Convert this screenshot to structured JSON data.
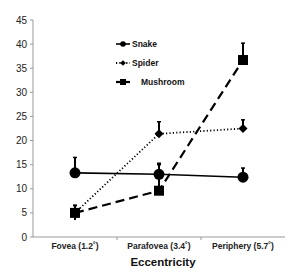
{
  "chart_data": {
    "type": "line",
    "title": "",
    "xlabel": "Eccentricity",
    "ylabel": "",
    "ylim": [
      0,
      45
    ],
    "yticks": [
      0,
      5,
      10,
      15,
      20,
      25,
      30,
      35,
      40,
      45
    ],
    "categories": [
      "Fovea (1.2˚)",
      "Parafovea (3.4˚)",
      "Periphery (5.7˚)"
    ],
    "grid": false,
    "legend_position": "top-center",
    "series": [
      {
        "name": "Snake",
        "marker": "circle",
        "line_style": "solid",
        "values": [
          13.3,
          13.0,
          12.4
        ],
        "error_upper": [
          16.5,
          15.3,
          14.3
        ],
        "color": "#000000"
      },
      {
        "name": "Spider",
        "marker": "diamond",
        "line_style": "dotted",
        "values": [
          5.0,
          21.4,
          22.5
        ],
        "error_upper": [
          6.5,
          23.9,
          24.3
        ],
        "color": "#000000"
      },
      {
        "name": "Mushroom",
        "marker": "square",
        "line_style": "dashed",
        "values": [
          5.0,
          9.6,
          36.7
        ],
        "error_upper": [
          6.6,
          15.0,
          40.2
        ],
        "error_lower": [
          3.5,
          null,
          null
        ],
        "color": "#000000"
      }
    ]
  }
}
